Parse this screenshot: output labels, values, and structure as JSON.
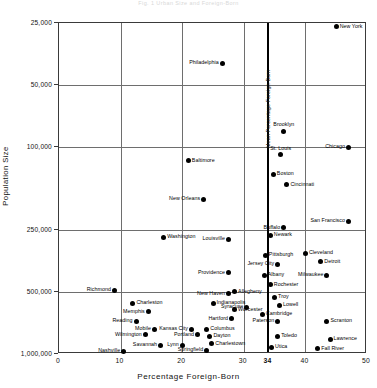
{
  "title": "Fig. 1  Urban Size and Foreign-Born",
  "axes": {
    "ylabel": "Population  Size",
    "xlabel": "Percentage  Foreign-Born",
    "yticks": [
      "1,000,000",
      "500,000",
      "250,000",
      "100,000",
      "50,000",
      "25,000"
    ],
    "xticks": [
      "0",
      "10",
      "20",
      "30",
      "34",
      "40",
      "50"
    ],
    "mean_label": "Mean Percentage Foreign-Born"
  },
  "chart_data": {
    "type": "scatter",
    "title": "Fig. 1  Urban Size and Foreign-Born",
    "xlabel": "Percentage Foreign-Born",
    "ylabel": "Population Size",
    "xlim": [
      0,
      50
    ],
    "ylim": [
      25000,
      1000000
    ],
    "yscale": "log",
    "yticks": [
      25000,
      50000,
      100000,
      250000,
      500000,
      1000000
    ],
    "xticks": [
      0,
      10,
      20,
      30,
      34,
      40,
      50
    ],
    "grid": true,
    "legend": "none",
    "annotations": [
      {
        "text": "Mean Percentage Foreign-Born",
        "x": 34,
        "orientation": "vertical-rule"
      }
    ],
    "points": [
      {
        "name": "New York",
        "x": 45.0,
        "y": 960000,
        "side": "r"
      },
      {
        "name": "Philadelphia",
        "x": 26.5,
        "y": 640000,
        "side": "l"
      },
      {
        "name": "Brooklyn",
        "x": 36.5,
        "y": 300000,
        "side": "t"
      },
      {
        "name": "Chicago",
        "x": 47.0,
        "y": 250000,
        "side": "l"
      },
      {
        "name": "St. Louis",
        "x": 36.0,
        "y": 230000,
        "side": "t"
      },
      {
        "name": "Boston",
        "x": 34.8,
        "y": 185000,
        "side": "r"
      },
      {
        "name": "Baltimore",
        "x": 21.0,
        "y": 215000,
        "side": "r"
      },
      {
        "name": "Cincinnati",
        "x": 37.0,
        "y": 165000,
        "side": "r"
      },
      {
        "name": "New Orleans",
        "x": 23.5,
        "y": 140000,
        "side": "l"
      },
      {
        "name": "San Francisco",
        "x": 47.0,
        "y": 110000,
        "side": "l"
      },
      {
        "name": "Buffalo",
        "x": 36.5,
        "y": 102000,
        "side": "l"
      },
      {
        "name": "Newark",
        "x": 34.3,
        "y": 94000,
        "side": "r"
      },
      {
        "name": "Louisville",
        "x": 27.5,
        "y": 90000,
        "side": "l"
      },
      {
        "name": "Washington",
        "x": 17.0,
        "y": 92000,
        "side": "r"
      },
      {
        "name": "Cleveland",
        "x": 40.0,
        "y": 77000,
        "side": "r"
      },
      {
        "name": "Pittsburgh",
        "x": 33.5,
        "y": 75000,
        "side": "r"
      },
      {
        "name": "Detroit",
        "x": 42.5,
        "y": 70000,
        "side": "r"
      },
      {
        "name": "Jersey City",
        "x": 35.5,
        "y": 68000,
        "side": "l"
      },
      {
        "name": "Milwaukee",
        "x": 43.5,
        "y": 60000,
        "side": "l"
      },
      {
        "name": "Providence",
        "x": 27.5,
        "y": 62000,
        "side": "l"
      },
      {
        "name": "Albany",
        "x": 33.3,
        "y": 60000,
        "side": "r"
      },
      {
        "name": "Rochester",
        "x": 34.3,
        "y": 54000,
        "side": "r"
      },
      {
        "name": "Richmond",
        "x": 9.0,
        "y": 51000,
        "side": "l"
      },
      {
        "name": "Allegheny",
        "x": 28.5,
        "y": 50000,
        "side": "r"
      },
      {
        "name": "New Haven",
        "x": 27.5,
        "y": 49000,
        "side": "l"
      },
      {
        "name": "Troy",
        "x": 35.0,
        "y": 47000,
        "side": "r"
      },
      {
        "name": "Charleston",
        "x": 12.0,
        "y": 44000,
        "side": "r"
      },
      {
        "name": "Indianapolis",
        "x": 25.0,
        "y": 44000,
        "side": "r"
      },
      {
        "name": "Lowell",
        "x": 35.8,
        "y": 43000,
        "side": "r"
      },
      {
        "name": "Syracuse",
        "x": 30.5,
        "y": 42000,
        "side": "l"
      },
      {
        "name": "Worcester",
        "x": 28.5,
        "y": 41000,
        "side": "r"
      },
      {
        "name": "Cambridge",
        "x": 33.0,
        "y": 39000,
        "side": "r"
      },
      {
        "name": "Memphis",
        "x": 14.5,
        "y": 40000,
        "side": "l"
      },
      {
        "name": "Reading",
        "x": 12.5,
        "y": 36000,
        "side": "l"
      },
      {
        "name": "Hartford",
        "x": 28.0,
        "y": 37000,
        "side": "l"
      },
      {
        "name": "Paterson",
        "x": 35.5,
        "y": 36000,
        "side": "l"
      },
      {
        "name": "Scranton",
        "x": 43.5,
        "y": 36000,
        "side": "r"
      },
      {
        "name": "Mobile",
        "x": 15.5,
        "y": 33000,
        "side": "l"
      },
      {
        "name": "Kansas City",
        "x": 21.5,
        "y": 33000,
        "side": "l"
      },
      {
        "name": "Columbus",
        "x": 24.0,
        "y": 33000,
        "side": "r"
      },
      {
        "name": "Wilmington",
        "x": 14.0,
        "y": 31000,
        "side": "l"
      },
      {
        "name": "Portland",
        "x": 22.5,
        "y": 31000,
        "side": "l"
      },
      {
        "name": "Dayton",
        "x": 24.5,
        "y": 30500,
        "side": "r"
      },
      {
        "name": "Toledo",
        "x": 35.5,
        "y": 30500,
        "side": "r"
      },
      {
        "name": "Lawrence",
        "x": 44.0,
        "y": 29500,
        "side": "r"
      },
      {
        "name": "Savannah",
        "x": 16.5,
        "y": 27500,
        "side": "l"
      },
      {
        "name": "Lynn",
        "x": 20.0,
        "y": 27500,
        "side": "l"
      },
      {
        "name": "Charlestown",
        "x": 24.8,
        "y": 28000,
        "side": "r"
      },
      {
        "name": "Utica",
        "x": 34.5,
        "y": 27000,
        "side": "r"
      },
      {
        "name": "Springfield",
        "x": 24.0,
        "y": 26000,
        "side": "l"
      },
      {
        "name": "Fall River",
        "x": 42.0,
        "y": 26500,
        "side": "r"
      },
      {
        "name": "Nashville",
        "x": 10.5,
        "y": 25800,
        "side": "l"
      }
    ]
  }
}
